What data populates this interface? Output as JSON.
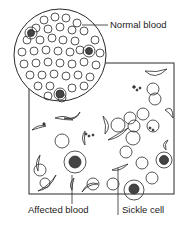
{
  "labels": {
    "normal_blood": "Normal blood",
    "affected_blood": "Affected blood",
    "sickle_cell": "Sickle cell"
  },
  "colors": {
    "line": "#2a2a2a",
    "background": "#ffffff"
  }
}
